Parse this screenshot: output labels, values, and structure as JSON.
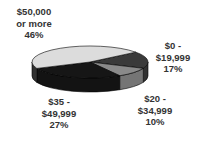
{
  "chart_data": {
    "type": "pie",
    "style": "3d",
    "title": "",
    "categories": [
      "$0 - $19,999",
      "$20 - $34,999",
      "$35 - $49,999",
      "$50,000 or more"
    ],
    "values": [
      17,
      10,
      27,
      46
    ],
    "unit": "%",
    "colors": [
      "#3a3a3a",
      "#8a8a8a",
      "#161616",
      "#dcdcdc"
    ],
    "legend": "none (labels placed around slices)"
  },
  "labels": {
    "s50k": {
      "line1": "$50,000",
      "line2": "or more",
      "pct": "46%"
    },
    "s0": {
      "line1": "$0 -",
      "line2": "$19,999",
      "pct": "17%"
    },
    "s20": {
      "line1": "$20 -",
      "line2": "$34,999",
      "pct": "10%"
    },
    "s35": {
      "line1": "$35 -",
      "line2": "$49,999",
      "pct": "27%"
    }
  }
}
